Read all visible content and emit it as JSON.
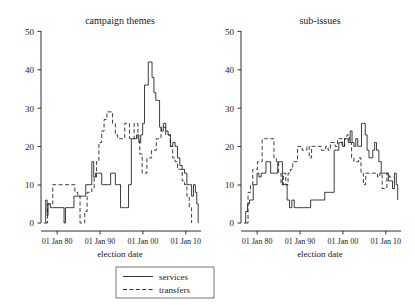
{
  "figure": {
    "background_color": "#ffffff",
    "ink_color": "#1a1a1a",
    "width": 415,
    "height": 305
  },
  "legend": {
    "position": "bottom-center",
    "entries": [
      {
        "label": "services",
        "style": "solid"
      },
      {
        "label": "transfers",
        "style": "dashed"
      }
    ]
  },
  "chart_data": [
    {
      "type": "line",
      "title": "campaign themes",
      "xlabel": "election date",
      "ylabel": "",
      "panel": "left",
      "xlim": [
        1977,
        2011
      ],
      "ylim": [
        0,
        50
      ],
      "yticks": [
        0,
        10,
        20,
        30,
        40,
        50
      ],
      "ytick_labels": [
        "0",
        "10",
        "20",
        "30",
        "40",
        "50"
      ],
      "xticks": [
        1980,
        1990,
        2000,
        2010
      ],
      "xtick_labels": [
        "01 Jan 80",
        "01 Jan 90",
        "01 Jan 00",
        "01 Jan 10"
      ],
      "grid": false,
      "drawstyle": "steps-post",
      "series": [
        {
          "name": "services",
          "style": "solid",
          "x": [
            1977.6,
            1978.0,
            1978.3,
            1978.5,
            1979.0,
            1979.4,
            1981.0,
            1981.5,
            1981.9,
            1982.2,
            1983.0,
            1984.0,
            1985.0,
            1986.0,
            1986.5,
            1987.0,
            1987.4,
            1987.8,
            1988.2,
            1988.6,
            1989.0,
            1989.4,
            1989.9,
            1990.3,
            1990.8,
            1991.3,
            1991.8,
            1992.3,
            1992.8,
            1993.3,
            1993.9,
            1994.4,
            1995.0,
            1995.6,
            1996.2,
            1996.8,
            1997.3,
            1997.8,
            1998.2,
            1998.6,
            1999.0,
            1999.4,
            1999.8,
            2000.2,
            2000.6,
            2001.0,
            2001.4,
            2001.8,
            2002.2,
            2002.6,
            2003.0,
            2003.5,
            2004.0,
            2004.5,
            2005.0,
            2005.5,
            2006.0,
            2006.5,
            2007.0,
            2007.5,
            2008.0,
            2008.5,
            2009.0,
            2009.4,
            2009.8,
            2010.1,
            2010.4
          ],
          "y": [
            0,
            6,
            2,
            5,
            4,
            4,
            4,
            4,
            0,
            4,
            4,
            7,
            7,
            7,
            10,
            10,
            10,
            16,
            12,
            13,
            13,
            13,
            10,
            10,
            10,
            10,
            13,
            13,
            10,
            10,
            4,
            4,
            4,
            10,
            22,
            22,
            23,
            21,
            23,
            26,
            36,
            36,
            42,
            42,
            38,
            34,
            32,
            32,
            25,
            24,
            26,
            24,
            23,
            20,
            21,
            20,
            17,
            15,
            14,
            13,
            10,
            10,
            7,
            10,
            8,
            5,
            0
          ]
        },
        {
          "name": "transfers",
          "style": "dashed",
          "x": [
            1978.0,
            1978.4,
            1979.0,
            1979.5,
            1980.0,
            1981.0,
            1982.0,
            1983.0,
            1983.6,
            1984.2,
            1984.8,
            1985.3,
            1985.8,
            1986.3,
            1986.8,
            1987.3,
            1987.8,
            1988.3,
            1988.8,
            1989.3,
            1989.9,
            1990.4,
            1991.0,
            1991.6,
            1992.2,
            1992.8,
            1993.3,
            1993.8,
            1994.3,
            1994.8,
            1995.3,
            1995.8,
            1996.3,
            1996.8,
            1997.2,
            1997.6,
            1998.0,
            1998.5,
            1999.0,
            1999.5,
            2000.0,
            2000.5,
            2001.0,
            2001.5,
            2002.0,
            2002.5,
            2003.0,
            2003.5,
            2004.0,
            2004.5,
            2005.0,
            2005.5,
            2006.0,
            2006.5,
            2007.0,
            2007.5,
            2008.0,
            2008.5,
            2009.0
          ],
          "y": [
            0,
            5,
            5,
            10,
            10,
            10,
            10,
            10,
            10,
            8,
            7,
            0,
            0,
            3,
            8,
            8,
            9,
            12,
            16,
            21,
            24,
            27,
            29,
            29,
            26,
            23,
            22,
            22,
            22,
            26,
            26,
            22,
            22,
            26,
            26,
            22,
            18,
            13,
            13,
            17,
            17,
            19,
            19,
            22,
            22,
            25,
            25,
            23,
            23,
            20,
            17,
            16,
            14,
            14,
            11,
            10,
            7,
            4,
            0
          ]
        }
      ]
    },
    {
      "type": "line",
      "title": "sub-issues",
      "xlabel": "election date",
      "ylabel": "",
      "panel": "right",
      "xlim": [
        1977,
        2011
      ],
      "ylim": [
        0,
        50
      ],
      "yticks": [
        0,
        10,
        20,
        30,
        40,
        50
      ],
      "ytick_labels": [
        "0",
        "10",
        "20",
        "30",
        "40",
        "50"
      ],
      "xticks": [
        1980,
        1990,
        2000,
        2010
      ],
      "xtick_labels": [
        "01 Jan 80",
        "01 Jan 90",
        "01 Jan 00",
        "01 Jan 10"
      ],
      "grid": false,
      "drawstyle": "steps-post",
      "series": [
        {
          "name": "services",
          "style": "solid",
          "x": [
            1977.6,
            1978.0,
            1978.4,
            1978.8,
            1979.2,
            1979.6,
            1980.0,
            1980.4,
            1980.8,
            1981.3,
            1981.8,
            1982.3,
            1982.8,
            1983.3,
            1983.8,
            1984.3,
            1984.8,
            1985.3,
            1985.8,
            1986.3,
            1986.8,
            1987.3,
            1987.8,
            1988.3,
            1988.8,
            1989.3,
            1989.8,
            1990.3,
            1990.8,
            1991.3,
            1991.8,
            1992.3,
            1992.8,
            1993.3,
            1993.8,
            1994.3,
            1994.8,
            1995.3,
            1995.8,
            1996.3,
            1996.8,
            1997.3,
            1997.8,
            1998.2,
            1998.6,
            1999.0,
            1999.4,
            1999.8,
            2000.2,
            2000.6,
            2001.0,
            2001.4,
            2001.8,
            2002.2,
            2002.6,
            2003.0,
            2003.4,
            2003.8,
            2004.2,
            2004.6,
            2005.0,
            2005.4,
            2005.8,
            2006.3,
            2006.8,
            2007.3,
            2007.8,
            2008.3,
            2008.8,
            2009.2,
            2009.6,
            2010.0,
            2010.3
          ],
          "y": [
            0,
            3,
            5,
            6,
            6,
            10,
            10,
            13,
            12,
            13,
            13,
            16,
            16,
            13,
            13,
            13,
            16,
            16,
            10,
            10,
            6,
            4,
            6,
            4,
            4,
            4,
            4,
            4,
            4,
            4,
            6,
            6,
            6,
            6,
            6,
            6,
            8,
            8,
            8,
            8,
            19,
            19,
            21,
            21,
            20,
            22,
            22,
            21,
            24,
            21,
            20,
            22,
            20,
            20,
            26,
            26,
            23,
            19,
            17,
            17,
            19,
            21,
            19,
            16,
            13,
            13,
            13,
            11,
            11,
            9,
            13,
            10,
            6
          ]
        },
        {
          "name": "transfers",
          "style": "dashed",
          "x": [
            1978.0,
            1978.5,
            1979.0,
            1979.5,
            1980.0,
            1980.5,
            1981.0,
            1981.5,
            1982.0,
            1982.5,
            1983.0,
            1983.5,
            1984.0,
            1984.5,
            1985.0,
            1985.5,
            1986.0,
            1986.5,
            1987.0,
            1987.5,
            1988.0,
            1988.5,
            1989.0,
            1989.5,
            1990.0,
            1990.5,
            1991.0,
            1991.5,
            1992.0,
            1992.5,
            1993.0,
            1993.5,
            1994.0,
            1994.5,
            1995.0,
            1995.5,
            1996.0,
            1996.5,
            1997.0,
            1997.5,
            1998.0,
            1998.5,
            1999.0,
            1999.5,
            2000.0,
            2000.5,
            2001.0,
            2001.5,
            2002.0,
            2002.5,
            2003.0,
            2003.5,
            2004.0,
            2004.5,
            2005.0,
            2005.5,
            2006.0,
            2006.5,
            2007.0,
            2007.5,
            2008.0,
            2008.5,
            2009.0,
            2009.5
          ],
          "y": [
            0,
            8,
            10,
            14,
            14,
            16,
            16,
            22,
            22,
            22,
            22,
            22,
            17,
            16,
            13,
            10,
            13,
            10,
            13,
            14,
            16,
            16,
            20,
            20,
            19,
            19,
            20,
            17,
            20,
            20,
            20,
            20,
            19,
            19,
            20,
            19,
            21,
            21,
            20,
            22,
            22,
            20,
            22,
            23,
            21,
            17,
            16,
            16,
            17,
            13,
            10,
            13,
            13,
            13,
            13,
            13,
            12,
            13,
            9,
            9,
            13,
            12,
            12,
            12
          ]
        }
      ]
    }
  ]
}
